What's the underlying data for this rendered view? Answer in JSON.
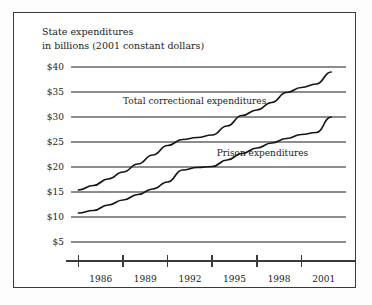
{
  "figure": {
    "title_line1": "State expenditures",
    "title_line2": "in billions (2001 constant dollars)",
    "frame_color": "#3a3a3a",
    "background_color": "#ffffff",
    "grid_color": "#8d8d8d",
    "line_color": "#161616"
  },
  "chart_data": {
    "type": "line",
    "title": "State expenditures in billions (2001 constant dollars)",
    "xlabel": "",
    "ylabel": "State expenditures in billions (2001 constant dollars)",
    "xlim": [
      1984.5,
      2003.0
    ],
    "ylim": [
      2.5,
      41.5
    ],
    "grid": true,
    "grid_axis": "y",
    "legend_position": "inline-annotations",
    "ytick_labels": [
      "$40",
      "$35",
      "$30",
      "$25",
      "$20",
      "$15",
      "$10",
      "$5"
    ],
    "ytick_values": [
      40,
      35,
      30,
      25,
      20,
      15,
      10,
      5
    ],
    "xtick_labels": [
      "1986",
      "1989",
      "1992",
      "1995",
      "1998",
      "2001"
    ],
    "xtick_label_values": [
      1986,
      1989,
      1992,
      1995,
      1998,
      2001
    ],
    "x_axis_tick_marks": [
      1985,
      1988,
      1991,
      1994,
      1997,
      2000
    ],
    "x": [
      1985,
      1986,
      1987,
      1988,
      1989,
      1990,
      1991,
      1992,
      1993,
      1994,
      1995,
      1996,
      1997,
      1998,
      1999,
      2000,
      2001,
      2002
    ],
    "series": [
      {
        "name": "Total correctional expenditures",
        "label": "Total correctional expenditures",
        "values": [
          15.4,
          16.3,
          17.6,
          19.0,
          20.6,
          22.4,
          24.3,
          25.5,
          25.9,
          26.4,
          28.2,
          30.3,
          31.4,
          32.9,
          34.9,
          35.9,
          36.6,
          39.0
        ]
      },
      {
        "name": "Prison expenditures",
        "label": "Prison expenditures",
        "values": [
          10.8,
          11.3,
          12.4,
          13.4,
          14.5,
          15.6,
          17.0,
          19.4,
          19.9,
          20.1,
          21.4,
          22.7,
          23.8,
          24.8,
          25.7,
          26.5,
          26.9,
          30.0
        ]
      }
    ],
    "annotations": [
      {
        "text": "Total correctional expenditures",
        "x": 1988.0,
        "y": 32.6
      },
      {
        "text": "Prison expenditures",
        "x": 1994.3,
        "y": 22.3
      }
    ]
  }
}
